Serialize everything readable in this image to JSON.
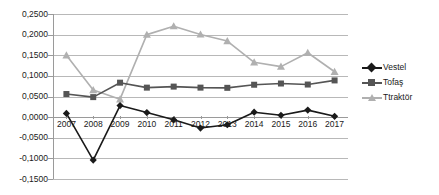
{
  "chart_data": {
    "type": "line",
    "title": "",
    "subtitle": "",
    "xlabel": "",
    "ylabel": "",
    "categories": [
      "2007",
      "2008",
      "2009",
      "2010",
      "2011",
      "2012",
      "2013",
      "2014",
      "2015",
      "2016",
      "2017"
    ],
    "ylim": [
      -0.15,
      0.25
    ],
    "ytick_step": 0.05,
    "ytick_labels": [
      "0,2500",
      "0,2000",
      "0,1500",
      "0,1000",
      "0,0500",
      "0,0000",
      "-0,0500",
      "-0,1000",
      "-0,1500"
    ],
    "ytick_values": [
      0.25,
      0.2,
      0.15,
      0.1,
      0.05,
      0.0,
      -0.05,
      -0.1,
      -0.15
    ],
    "grid": true,
    "grid_axis": "y",
    "legend_position": "right",
    "series": [
      {
        "name": "Vestel",
        "color": "#1a1a1a",
        "marker": "diamond",
        "values": [
          0.009,
          -0.104,
          0.028,
          0.011,
          -0.0065,
          -0.0265,
          -0.0185,
          0.012,
          0.0045,
          0.017,
          0.002
        ]
      },
      {
        "name": "Tofaş",
        "color": "#555555",
        "marker": "square",
        "values": [
          0.056,
          0.0485,
          0.0835,
          0.0715,
          0.074,
          0.0715,
          0.071,
          0.0785,
          0.0815,
          0.079,
          0.089
        ]
      },
      {
        "name": "Ttraktör",
        "color": "#b0b0b0",
        "marker": "triangle",
        "values": [
          0.15,
          0.0655,
          0.0435,
          0.2,
          0.2205,
          0.2005,
          0.1845,
          0.133,
          0.1225,
          0.156,
          0.11
        ]
      }
    ]
  },
  "legend": {
    "items": [
      {
        "label": "Vestel",
        "color": "#1a1a1a",
        "marker": "diamond"
      },
      {
        "label": "Tofaş",
        "color": "#555555",
        "marker": "square"
      },
      {
        "label": "Ttraktör",
        "color": "#b0b0b0",
        "marker": "triangle"
      }
    ]
  }
}
